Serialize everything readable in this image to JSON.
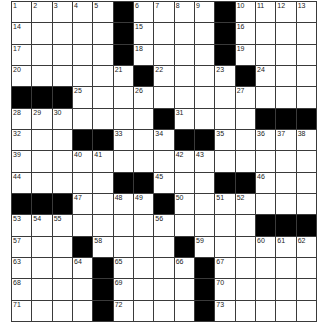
{
  "puzzle": {
    "rows": 15,
    "cols": 15,
    "accent": {
      "block": "#000000",
      "cell": "#ffffff",
      "line": "#3a3a3a",
      "number": "#222222"
    },
    "grid": [
      [
        "1",
        "2",
        "3",
        "4",
        "5",
        "#",
        "6",
        "7",
        "8",
        "9",
        "#",
        "10",
        "11",
        "12",
        "13"
      ],
      [
        "14",
        "",
        "",
        "",
        "",
        "#",
        "15",
        "",
        "",
        "",
        "#",
        "16",
        "",
        "",
        ""
      ],
      [
        "17",
        "",
        "",
        "",
        "",
        "#",
        "18",
        "",
        "",
        "",
        "#",
        "19",
        "",
        "",
        ""
      ],
      [
        "20",
        "",
        "",
        "",
        "",
        "21",
        "#",
        "22",
        "",
        "",
        "23",
        "#",
        "24",
        "",
        ""
      ],
      [
        "#",
        "#",
        "#",
        "25",
        "",
        "",
        "26",
        "",
        "",
        "",
        "",
        "27",
        "",
        "",
        ""
      ],
      [
        "28",
        "29",
        "30",
        "",
        "",
        "",
        "",
        "#",
        "31",
        "",
        "",
        "",
        "#",
        "#",
        "#"
      ],
      [
        "32",
        "",
        "",
        "#",
        "#",
        "33",
        "",
        "34",
        "#",
        "#",
        "35",
        "",
        "36",
        "37",
        "38"
      ],
      [
        "39",
        "",
        "",
        "40",
        "41",
        "",
        "",
        "",
        "42",
        "43",
        "",
        "",
        "",
        "",
        ""
      ],
      [
        "44",
        "",
        "",
        "",
        "",
        "#",
        "#",
        "45",
        "",
        "",
        "#",
        "#",
        "46",
        "",
        ""
      ],
      [
        "#",
        "#",
        "#",
        "47",
        "",
        "48",
        "49",
        "#",
        "50",
        "",
        "51",
        "52",
        "",
        "",
        ""
      ],
      [
        "53",
        "54",
        "55",
        "",
        "",
        "",
        "",
        "56",
        "",
        "",
        "",
        "",
        "#",
        "#",
        "#"
      ],
      [
        "57",
        "",
        "",
        "#",
        "58",
        "",
        "",
        "",
        "#",
        "59",
        "",
        "",
        "60",
        "61",
        "62"
      ],
      [
        "63",
        "",
        "",
        "64",
        "#",
        "65",
        "",
        "",
        "66",
        "#",
        "67",
        "",
        "",
        "",
        ""
      ],
      [
        "68",
        "",
        "",
        "",
        "#",
        "69",
        "",
        "",
        "",
        "#",
        "70",
        "",
        "",
        "",
        ""
      ],
      [
        "71",
        "",
        "",
        "",
        "#",
        "72",
        "",
        "",
        "",
        "#",
        "73",
        "",
        "",
        "",
        ""
      ]
    ],
    "entries": {}
  }
}
